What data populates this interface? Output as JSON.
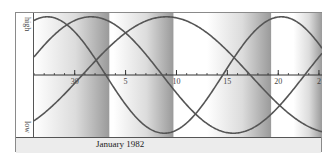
{
  "chart_data": {
    "type": "line",
    "title": "",
    "xlabel": "January 1982",
    "ylabel": "",
    "y_labels": {
      "top": "high",
      "bottom": "low"
    },
    "ylim": [
      -1,
      1
    ],
    "x_ticks": [
      {
        "label": "30",
        "day_offset": 4
      },
      {
        "label": "5",
        "day_offset": 9
      },
      {
        "label": "10",
        "day_offset": 14
      },
      {
        "label": "15",
        "day_offset": 19
      },
      {
        "label": "20",
        "day_offset": 24
      },
      {
        "label": "2",
        "day_offset": 28
      }
    ],
    "x_range_days": [
      0,
      28.3
    ],
    "grid": false,
    "series": [
      {
        "name": "curve-a",
        "period_days": 28,
        "peak_day_offset": 5.6,
        "color": "#555555"
      },
      {
        "name": "curve-b",
        "period_days": 23,
        "peak_day_offset": 1.3,
        "color": "#555555"
      },
      {
        "name": "curve-c",
        "period_days": 33,
        "peak_day_offset": 13.0,
        "color": "#555555"
      }
    ],
    "shaded_bands": [
      {
        "from_day": 0.0,
        "to_day": 7.4
      },
      {
        "from_day": 7.8,
        "to_day": 13.7
      },
      {
        "from_day": 17.0,
        "to_day": 23.3
      },
      {
        "from_day": 25.5,
        "to_day": 28.3
      }
    ]
  },
  "labels": {
    "high": "high",
    "low": "low",
    "month": "January 1982"
  }
}
